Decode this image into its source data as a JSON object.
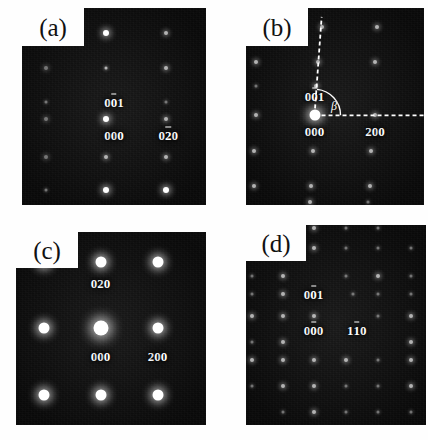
{
  "figure": {
    "background": "#fefefe",
    "field_color": "#0d0d0d",
    "spot_color": "#ffffff",
    "panels": [
      {
        "id": "a",
        "letter": "(a)",
        "box": {
          "x": 22,
          "y": 8,
          "w": 184,
          "h": 197
        },
        "notch": {
          "w": 62,
          "h": 38
        },
        "lattice": {
          "type": "rectangular",
          "columns": 3,
          "rows": 5
        },
        "labels": [
          {
            "text": "001",
            "overbar_index": 1,
            "x": 0.5,
            "y": 0.475
          },
          {
            "text": "000",
            "overbar_index": -1,
            "x": 0.5,
            "y": 0.645
          },
          {
            "text": "020",
            "overbar_index": 1,
            "x": 0.795,
            "y": 0.645
          }
        ],
        "spots": [
          {
            "x": 0.13,
            "y": 0.125,
            "size": "s-xs",
            "tone": "faint"
          },
          {
            "x": 0.455,
            "y": 0.125,
            "size": "s-md",
            "tone": ""
          },
          {
            "x": 0.785,
            "y": 0.125,
            "size": "s-sm",
            "tone": "dim"
          },
          {
            "x": 0.13,
            "y": 0.305,
            "size": "s-sm",
            "tone": "faint"
          },
          {
            "x": 0.455,
            "y": 0.305,
            "size": "s-xs",
            "tone": "dim"
          },
          {
            "x": 0.785,
            "y": 0.305,
            "size": "s-sm",
            "tone": "dim"
          },
          {
            "x": 0.13,
            "y": 0.475,
            "size": "s-xs",
            "tone": "faint"
          },
          {
            "x": 0.785,
            "y": 0.475,
            "size": "s-xs",
            "tone": "faint"
          },
          {
            "x": 0.13,
            "y": 0.565,
            "size": "s-sm",
            "tone": "faint"
          },
          {
            "x": 0.455,
            "y": 0.565,
            "size": "s-md",
            "tone": ""
          },
          {
            "x": 0.785,
            "y": 0.565,
            "size": "s-sm",
            "tone": "dim"
          },
          {
            "x": 0.13,
            "y": 0.755,
            "size": "s-sm",
            "tone": "faint"
          },
          {
            "x": 0.455,
            "y": 0.755,
            "size": "s-sm",
            "tone": "dim"
          },
          {
            "x": 0.785,
            "y": 0.755,
            "size": "s-sm",
            "tone": "dim"
          },
          {
            "x": 0.13,
            "y": 0.925,
            "size": "s-xs",
            "tone": "faint"
          },
          {
            "x": 0.455,
            "y": 0.925,
            "size": "s-md",
            "tone": ""
          },
          {
            "x": 0.785,
            "y": 0.925,
            "size": "s-md",
            "tone": ""
          }
        ]
      },
      {
        "id": "b",
        "letter": "(b)",
        "box": {
          "x": 246,
          "y": 8,
          "w": 178,
          "h": 197
        },
        "notch": {
          "w": 62,
          "h": 38
        },
        "lattice": {
          "type": "monoclinic",
          "columns": 4,
          "rows": 6
        },
        "labels": [
          {
            "text": "001",
            "overbar_index": 1,
            "x": 0.385,
            "y": 0.445
          },
          {
            "text": "000",
            "overbar_index": -1,
            "x": 0.385,
            "y": 0.625
          },
          {
            "text": "200",
            "overbar_index": -1,
            "x": 0.725,
            "y": 0.625
          }
        ],
        "angle": {
          "symbol": "β",
          "x": 0.495,
          "y": 0.495
        },
        "guides": {
          "vertical": {
            "x1": 0.385,
            "y1": 0.545,
            "x2": 0.425,
            "y2": 0.045
          },
          "horizontal": {
            "x1": 0.385,
            "y1": 0.545,
            "x2": 1.0,
            "y2": 0.545
          }
        },
        "spots": [
          {
            "x": 0.055,
            "y": 0.095,
            "size": "s-xs",
            "tone": "faint"
          },
          {
            "x": 0.425,
            "y": 0.095,
            "size": "s-sm",
            "tone": "dim"
          },
          {
            "x": 0.735,
            "y": 0.095,
            "size": "s-sm",
            "tone": "dim"
          },
          {
            "x": 0.055,
            "y": 0.275,
            "size": "s-sm",
            "tone": "dim"
          },
          {
            "x": 0.405,
            "y": 0.275,
            "size": "s-sm",
            "tone": "dim"
          },
          {
            "x": 0.725,
            "y": 0.275,
            "size": "s-sm",
            "tone": "dim"
          },
          {
            "x": 0.055,
            "y": 0.395,
            "size": "s-xs",
            "tone": "faint"
          },
          {
            "x": 0.395,
            "y": 0.395,
            "size": "s-sm",
            "tone": "dim"
          },
          {
            "x": 0.055,
            "y": 0.545,
            "size": "s-sm",
            "tone": "dim"
          },
          {
            "x": 0.385,
            "y": 0.545,
            "size": "s-lg",
            "tone": ""
          },
          {
            "x": 0.725,
            "y": 0.545,
            "size": "s-sm",
            "tone": "dim"
          },
          {
            "x": 0.045,
            "y": 0.725,
            "size": "s-sm",
            "tone": "dim"
          },
          {
            "x": 0.375,
            "y": 0.725,
            "size": "s-sm",
            "tone": "dim"
          },
          {
            "x": 0.705,
            "y": 0.725,
            "size": "s-sm",
            "tone": "dim"
          },
          {
            "x": 0.045,
            "y": 0.905,
            "size": "s-sm",
            "tone": "dim"
          },
          {
            "x": 0.365,
            "y": 0.905,
            "size": "s-sm",
            "tone": "dim"
          },
          {
            "x": 0.695,
            "y": 0.905,
            "size": "s-sm",
            "tone": "dim"
          },
          {
            "x": 0.36,
            "y": 0.985,
            "size": "s-sm",
            "tone": "dim"
          },
          {
            "x": 0.685,
            "y": 0.985,
            "size": "s-xs",
            "tone": "faint"
          }
        ]
      },
      {
        "id": "c",
        "letter": "(c)",
        "box": {
          "x": 16,
          "y": 232,
          "w": 190,
          "h": 193
        },
        "notch": {
          "w": 62,
          "h": 36
        },
        "lattice": {
          "type": "square",
          "columns": 3,
          "rows": 3
        },
        "labels": [
          {
            "text": "020",
            "overbar_index": -1,
            "x": 0.445,
            "y": 0.265
          },
          {
            "text": "000",
            "overbar_index": -1,
            "x": 0.445,
            "y": 0.645
          },
          {
            "text": "200",
            "overbar_index": -1,
            "x": 0.745,
            "y": 0.645
          }
        ],
        "spots": [
          {
            "x": 0.145,
            "y": 0.155,
            "size": "s-lg",
            "tone": ""
          },
          {
            "x": 0.445,
            "y": 0.155,
            "size": "s-lg",
            "tone": ""
          },
          {
            "x": 0.745,
            "y": 0.155,
            "size": "s-lg",
            "tone": ""
          },
          {
            "x": 0.145,
            "y": 0.495,
            "size": "s-lg",
            "tone": ""
          },
          {
            "x": 0.445,
            "y": 0.495,
            "size": "s-xl",
            "tone": ""
          },
          {
            "x": 0.745,
            "y": 0.495,
            "size": "s-lg",
            "tone": ""
          },
          {
            "x": 0.145,
            "y": 0.845,
            "size": "s-lg",
            "tone": ""
          },
          {
            "x": 0.445,
            "y": 0.845,
            "size": "s-lg",
            "tone": ""
          },
          {
            "x": 0.745,
            "y": 0.845,
            "size": "s-lg",
            "tone": ""
          }
        ]
      },
      {
        "id": "d",
        "letter": "(d)",
        "box": {
          "x": 246,
          "y": 225,
          "w": 180,
          "h": 200
        },
        "notch": {
          "w": 60,
          "h": 36
        },
        "lattice": {
          "type": "square",
          "columns": 5,
          "rows": 7
        },
        "labels": [
          {
            "text": "001",
            "overbar_index": 1,
            "x": 0.375,
            "y": 0.345
          },
          {
            "text": "000",
            "overbar_index": 1,
            "x": 0.375,
            "y": 0.525
          },
          {
            "text": "110",
            "overbar_index": 1,
            "x": 0.615,
            "y": 0.525
          }
        ],
        "spots": [
          {
            "x": 0.205,
            "y": 0.015,
            "size": "s-xs",
            "tone": "faint"
          },
          {
            "x": 0.375,
            "y": 0.015,
            "size": "s-sm",
            "tone": "dim"
          },
          {
            "x": 0.555,
            "y": 0.015,
            "size": "s-xs",
            "tone": "faint"
          },
          {
            "x": 0.735,
            "y": 0.015,
            "size": "s-xs",
            "tone": "faint"
          },
          {
            "x": 0.205,
            "y": 0.115,
            "size": "s-sm",
            "tone": "dim"
          },
          {
            "x": 0.375,
            "y": 0.115,
            "size": "s-sm",
            "tone": "dim"
          },
          {
            "x": 0.555,
            "y": 0.115,
            "size": "s-xs",
            "tone": "faint"
          },
          {
            "x": 0.735,
            "y": 0.115,
            "size": "s-xs",
            "tone": "faint"
          },
          {
            "x": 0.915,
            "y": 0.115,
            "size": "s-xs",
            "tone": "faint"
          },
          {
            "x": 0.035,
            "y": 0.255,
            "size": "s-xs",
            "tone": "faint"
          },
          {
            "x": 0.205,
            "y": 0.255,
            "size": "s-sm",
            "tone": "dim"
          },
          {
            "x": 0.555,
            "y": 0.255,
            "size": "s-xs",
            "tone": "faint"
          },
          {
            "x": 0.735,
            "y": 0.255,
            "size": "s-sm",
            "tone": "dim"
          },
          {
            "x": 0.915,
            "y": 0.255,
            "size": "s-xs",
            "tone": "faint"
          },
          {
            "x": 0.035,
            "y": 0.345,
            "size": "s-xs",
            "tone": "faint"
          },
          {
            "x": 0.205,
            "y": 0.345,
            "size": "s-sm",
            "tone": "dim"
          },
          {
            "x": 0.595,
            "y": 0.345,
            "size": "s-xs",
            "tone": "faint"
          },
          {
            "x": 0.735,
            "y": 0.345,
            "size": "s-xs",
            "tone": "faint"
          },
          {
            "x": 0.915,
            "y": 0.345,
            "size": "s-xs",
            "tone": "faint"
          },
          {
            "x": 0.035,
            "y": 0.455,
            "size": "s-sm",
            "tone": "dim"
          },
          {
            "x": 0.205,
            "y": 0.455,
            "size": "s-sm",
            "tone": "dim"
          },
          {
            "x": 0.375,
            "y": 0.455,
            "size": "s-sm",
            "tone": "dim"
          },
          {
            "x": 0.735,
            "y": 0.455,
            "size": "s-xs",
            "tone": "faint"
          },
          {
            "x": 0.915,
            "y": 0.455,
            "size": "s-sm",
            "tone": "dim"
          },
          {
            "x": 0.035,
            "y": 0.585,
            "size": "s-xs",
            "tone": "faint"
          },
          {
            "x": 0.205,
            "y": 0.585,
            "size": "s-sm",
            "tone": "dim"
          },
          {
            "x": 0.915,
            "y": 0.585,
            "size": "s-sm",
            "tone": "dim"
          },
          {
            "x": 0.035,
            "y": 0.675,
            "size": "s-sm",
            "tone": "dim"
          },
          {
            "x": 0.205,
            "y": 0.675,
            "size": "s-sm",
            "tone": "dim"
          },
          {
            "x": 0.375,
            "y": 0.675,
            "size": "s-sm",
            "tone": "dim"
          },
          {
            "x": 0.555,
            "y": 0.675,
            "size": "s-sm",
            "tone": "dim"
          },
          {
            "x": 0.735,
            "y": 0.675,
            "size": "s-xs",
            "tone": "faint"
          },
          {
            "x": 0.915,
            "y": 0.675,
            "size": "s-sm",
            "tone": "dim"
          },
          {
            "x": 0.035,
            "y": 0.805,
            "size": "s-xs",
            "tone": "faint"
          },
          {
            "x": 0.205,
            "y": 0.805,
            "size": "s-sm",
            "tone": "dim"
          },
          {
            "x": 0.375,
            "y": 0.805,
            "size": "s-sm",
            "tone": "dim"
          },
          {
            "x": 0.555,
            "y": 0.805,
            "size": "s-xs",
            "tone": "faint"
          },
          {
            "x": 0.735,
            "y": 0.805,
            "size": "s-xs",
            "tone": "faint"
          },
          {
            "x": 0.915,
            "y": 0.805,
            "size": "s-sm",
            "tone": "dim"
          },
          {
            "x": 0.205,
            "y": 0.935,
            "size": "s-xs",
            "tone": "faint"
          },
          {
            "x": 0.375,
            "y": 0.935,
            "size": "s-sm",
            "tone": "dim"
          },
          {
            "x": 0.555,
            "y": 0.935,
            "size": "s-xs",
            "tone": "faint"
          },
          {
            "x": 0.735,
            "y": 0.935,
            "size": "s-xs",
            "tone": "faint"
          },
          {
            "x": 0.915,
            "y": 0.935,
            "size": "s-xs",
            "tone": "faint"
          }
        ]
      }
    ]
  }
}
